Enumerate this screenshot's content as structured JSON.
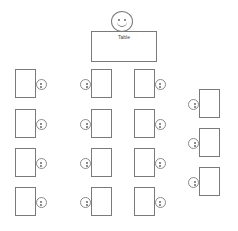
{
  "teacher": {
    "label": "Table",
    "icon": "smiley-face-icon"
  },
  "columns": [
    {
      "name": "column-1",
      "desks": [
        {
          "x": 15,
          "y": 69
        },
        {
          "x": 15,
          "y": 109
        },
        {
          "x": 15,
          "y": 148
        },
        {
          "x": 15,
          "y": 187
        }
      ],
      "face_side": "right"
    },
    {
      "name": "column-2",
      "desks": [
        {
          "x": 91,
          "y": 69
        },
        {
          "x": 91,
          "y": 109
        },
        {
          "x": 91,
          "y": 148
        },
        {
          "x": 91,
          "y": 187
        }
      ],
      "face_side": "left"
    },
    {
      "name": "column-3",
      "desks": [
        {
          "x": 134,
          "y": 69
        },
        {
          "x": 134,
          "y": 109
        },
        {
          "x": 134,
          "y": 148
        },
        {
          "x": 134,
          "y": 187
        }
      ],
      "face_side": "right"
    },
    {
      "name": "column-4",
      "desks": [
        {
          "x": 199,
          "y": 89
        },
        {
          "x": 199,
          "y": 128
        },
        {
          "x": 199,
          "y": 167
        }
      ],
      "face_side": "left"
    }
  ],
  "student_count": 15
}
